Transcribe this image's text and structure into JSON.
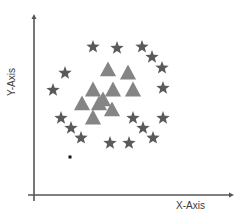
{
  "chart_data": {
    "type": "scatter",
    "title": "",
    "xlabel": "X-Axis",
    "ylabel": "Y-Axis",
    "xlim": [
      0,
      100
    ],
    "ylim": [
      0,
      100
    ],
    "grid": false,
    "legend": null,
    "ticks": {
      "x": [],
      "y": []
    },
    "series": [
      {
        "name": "stars",
        "marker": "star",
        "color": "#5a5a5a",
        "points": [
          {
            "x": 29.5,
            "y": 81.8
          },
          {
            "x": 41.5,
            "y": 81.2
          },
          {
            "x": 54.0,
            "y": 81.8
          },
          {
            "x": 59.0,
            "y": 76.2
          },
          {
            "x": 64.0,
            "y": 70.2
          },
          {
            "x": 15.5,
            "y": 67.4
          },
          {
            "x": 9.5,
            "y": 58.0
          },
          {
            "x": 64.5,
            "y": 59.1
          },
          {
            "x": 13.5,
            "y": 42.5
          },
          {
            "x": 18.5,
            "y": 37.0
          },
          {
            "x": 23.5,
            "y": 31.5
          },
          {
            "x": 49.5,
            "y": 42.5
          },
          {
            "x": 54.5,
            "y": 37.0
          },
          {
            "x": 59.5,
            "y": 31.5
          },
          {
            "x": 64.5,
            "y": 42.5
          },
          {
            "x": 38.0,
            "y": 28.7
          },
          {
            "x": 47.5,
            "y": 28.7
          }
        ]
      },
      {
        "name": "triangles",
        "marker": "triangle",
        "color": "#858585",
        "points": [
          {
            "x": 37.0,
            "y": 69.1
          },
          {
            "x": 47.0,
            "y": 67.4
          },
          {
            "x": 29.5,
            "y": 58.0
          },
          {
            "x": 39.5,
            "y": 58.0
          },
          {
            "x": 49.5,
            "y": 58.0
          },
          {
            "x": 24.0,
            "y": 50.3
          },
          {
            "x": 32.5,
            "y": 50.3
          },
          {
            "x": 34.5,
            "y": 52.5
          },
          {
            "x": 39.0,
            "y": 47.0
          },
          {
            "x": 29.5,
            "y": 42.5
          }
        ]
      },
      {
        "name": "dot",
        "marker": "square",
        "color": "#111111",
        "points": [
          {
            "x": 18.0,
            "y": 21.0
          }
        ]
      }
    ]
  },
  "layout": {
    "origin_px": [
      34,
      195
    ],
    "x_end_px": 234,
    "y_end_px": 14,
    "axis_color": "#555555"
  }
}
